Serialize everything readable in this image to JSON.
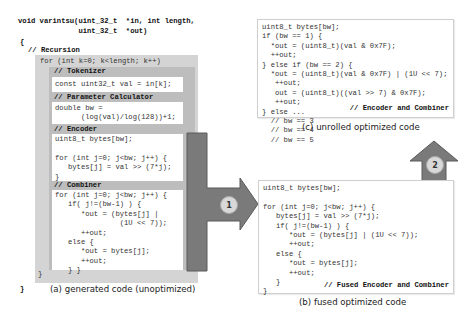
{
  "figure": {
    "panel_a": {
      "caption": "(a) generated code (unoptimized)",
      "signature_line1": "void varintsu(uint_32_t  *in, int length,",
      "signature_line2": "              uint_32_t  *out)",
      "open_brace": "{",
      "close_brace": "}",
      "recursion_comment": "// Recursion",
      "for_loop": "for (int k=0; k<length; k++)",
      "loop_close": "}",
      "stages": [
        {
          "comment": "// Tokenizer",
          "code": "const uint32_t val = in[k];"
        },
        {
          "comment": "// Parameter Calculator",
          "code": "double bw =\n      (log(val)/log(128))+1;"
        },
        {
          "comment": "// Encoder",
          "code": "uint8_t bytes[bw];\n\nfor (int j=0; j<bw; j++) {\n   bytes[j] = val >> (7*j);\n}"
        },
        {
          "comment": "// Combiner",
          "code": "for (int j=0; j<bw; j++) {\n   if( j!=(bw-1) ) {\n      *out = (bytes[j] |\n               (1U << 7));\n      ++out;\n   else {\n      *out = bytes[j];\n      ++out;\n   } }"
        }
      ]
    },
    "panel_b": {
      "caption": "(b) fused optimized code",
      "code": "uint8_t bytes[bw];\n\nfor (int j=0; j<bw; j++) {\n   bytes[j] = val >> (7*j);\n   if( j!=(bw-1) ) {\n      *out = (bytes[j] | (1U << 7));\n      ++out;\n   else {\n      *out = bytes[j];\n      ++out;\n   }\n}",
      "label": "// Fused Encoder and Combiner"
    },
    "panel_c": {
      "caption": "(c) unrolled optimized code",
      "code": "uint8_t bytes[bw];\nif (bw == 1) {\n  *out = (uint8_t)(val & 0x7F);\n  ++out;\n} else if (bw == 2) {\n  *out = (uint8_t)(val & 0x7F) | (1U << 7);\n   ++out;\n   out = (uint8_t)((val >> 7) & 0x7F);\n   ++out;\n} else ...\n  // bw == 3\n  // bw == 4\n  // bw == 5",
      "label": "// Encoder and Combiner"
    },
    "arrows": [
      {
        "step": "1",
        "from": "panel_a",
        "to": "panel_b"
      },
      {
        "step": "2",
        "from": "panel_b",
        "to": "panel_c"
      }
    ],
    "colors": {
      "outer_box": "#d4d4d4",
      "inner_box": "#bdbdbd",
      "arrow": "#7a7a7a",
      "arrow_border": "#5a5a5a",
      "step_circle": "#d8d8d8"
    }
  }
}
